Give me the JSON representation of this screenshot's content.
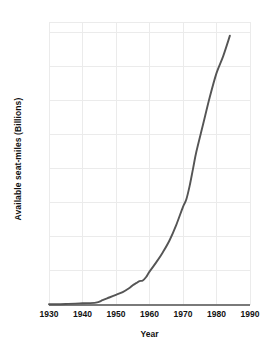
{
  "chart_data": {
    "type": "line",
    "title": "",
    "xlabel": "Year",
    "ylabel": "Available seat-miles (Billions)",
    "xlim": [
      1930,
      1990
    ],
    "ylim": [
      0,
      830
    ],
    "xticks": [
      1930,
      1940,
      1950,
      1960,
      1970,
      1980,
      1990
    ],
    "yticks": [
      100,
      200,
      300,
      400,
      500,
      600,
      700,
      800
    ],
    "xtick_labels": [
      "1930",
      "1940",
      "1950",
      "1960",
      "1970",
      "1980",
      "1990"
    ],
    "ytick_labels": [
      "100",
      "200",
      "300",
      "400",
      "500",
      "600",
      "700",
      "800"
    ],
    "grid": true,
    "legend": null,
    "series": [
      {
        "name": "Available seat-miles",
        "color": "#555555",
        "x": [
          1930,
          1935,
          1940,
          1944,
          1946,
          1948,
          1950,
          1952,
          1954,
          1955,
          1956,
          1957,
          1958,
          1959,
          1960,
          1962,
          1964,
          1966,
          1968,
          1970,
          1971,
          1972,
          1973,
          1974,
          1976,
          1978,
          1980,
          1982,
          1984
        ],
        "y": [
          2,
          3,
          5,
          7,
          14,
          22,
          30,
          38,
          50,
          58,
          64,
          70,
          72,
          82,
          98,
          125,
          155,
          190,
          235,
          288,
          310,
          350,
          400,
          450,
          530,
          610,
          680,
          730,
          790
        ]
      }
    ]
  },
  "axis_titles": {
    "y": "Available seat-miles (Billions)",
    "x": "Year"
  },
  "colors": {
    "line": "#555555",
    "grid": "#ebebeb",
    "axis": "#333333",
    "text": "#111111",
    "background": "#ffffff"
  }
}
